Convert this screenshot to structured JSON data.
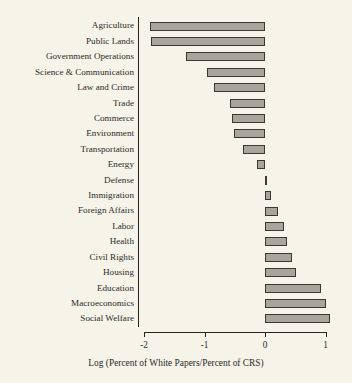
{
  "chart_data": {
    "type": "bar",
    "orientation": "horizontal",
    "title": "",
    "xlabel": "Log (Percent of White Papers/Percent of CRS)",
    "ylabel": "",
    "xlim": [
      -2.0,
      1.15
    ],
    "xticks": [
      -2,
      -1,
      0,
      1
    ],
    "xticklabels": [
      "-2",
      "-1",
      "0",
      "1"
    ],
    "grid": false,
    "legend": null,
    "baseline": 0,
    "categories": [
      "Agriculture",
      "Public Lands",
      "Government Operations",
      "Science & Communication",
      "Law and Crime",
      "Trade",
      "Commerce",
      "Environment",
      "Transportation",
      "Energy",
      "Defense",
      "Foreign Affairs",
      "Immigration",
      "Labor",
      "Health",
      "Civil Rights",
      "Housing",
      "Education",
      "Macroeconomics",
      "Social Welfare"
    ],
    "values": [
      -1.9,
      -1.88,
      -1.31,
      -0.96,
      -0.84,
      -0.58,
      -0.55,
      -0.51,
      -0.36,
      -0.13,
      0.02,
      0.1,
      0.21,
      0.32,
      0.36,
      0.45,
      0.52,
      0.93,
      1.0,
      1.08
    ],
    "bar_color": "#a9a59b",
    "bar_edge_color": "#3a3833",
    "background_color": "#f6f3e9",
    "axis_color": "#25241f"
  },
  "rows": [
    {
      "label": "Agriculture",
      "value": -1.9
    },
    {
      "label": "Public Lands",
      "value": -1.88
    },
    {
      "label": "Government Operations",
      "value": -1.31
    },
    {
      "label": "Science & Communication",
      "value": -0.96
    },
    {
      "label": "Law and Crime",
      "value": -0.84
    },
    {
      "label": "Trade",
      "value": -0.58
    },
    {
      "label": "Commerce",
      "value": -0.55
    },
    {
      "label": "Environment",
      "value": -0.51
    },
    {
      "label": "Transportation",
      "value": -0.36
    },
    {
      "label": "Energy",
      "value": -0.13
    },
    {
      "label": "Defense",
      "value": 0.02
    },
    {
      "label": "Immigration",
      "value": 0.1
    },
    {
      "label": "Foreign Affairs",
      "value": 0.21
    },
    {
      "label": "Labor",
      "value": 0.32
    },
    {
      "label": "Health",
      "value": 0.36
    },
    {
      "label": "Civil Rights",
      "value": 0.45
    },
    {
      "label": "Housing",
      "value": 0.52
    },
    {
      "label": "Education",
      "value": 0.93
    },
    {
      "label": "Macroeconomics",
      "value": 1.0
    },
    {
      "label": "Social Welfare",
      "value": 1.08
    }
  ],
  "axis": {
    "ticks": [
      {
        "value": -2,
        "label": "-2"
      },
      {
        "value": -1,
        "label": "-1"
      },
      {
        "value": 0,
        "label": "0"
      },
      {
        "value": 1,
        "label": "1"
      }
    ],
    "title": "Log (Percent of White Papers/Percent of CRS)"
  },
  "layout": {
    "x_at_zero_px": 265,
    "px_per_unit": 60.5,
    "first_row_center_y_px": 26,
    "row_step_px": 15.42,
    "bar_height_px": 9,
    "cat_axis_x_px": 138,
    "val_axis_y_px": 332
  }
}
